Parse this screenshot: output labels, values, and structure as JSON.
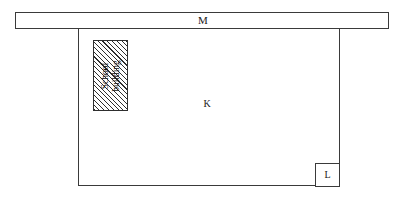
{
  "diagram": {
    "type": "site-plan",
    "canvas": {
      "width": 403,
      "height": 201,
      "background": "#ffffff"
    },
    "line_color": "#3a3a3a",
    "hatch_color": "#2e2e2e",
    "road_bar": {
      "label": "M",
      "name": "road-strip",
      "x": 15,
      "y": 12,
      "width": 374,
      "height": 17
    },
    "plot": {
      "label": "K",
      "name": "main-plot-area",
      "x": 78,
      "y": 28,
      "width": 262,
      "height": 158
    },
    "school_building": {
      "label_line1": "School",
      "label_line2": "building",
      "label_full": "School building",
      "fill": "diagonal-hatch",
      "rotation_deg": -90,
      "x": 93,
      "y": 40,
      "width": 35,
      "height": 71
    },
    "corner_box": {
      "label": "L",
      "name": "corner-parcel",
      "x": 315,
      "y": 163,
      "width": 25,
      "height": 24
    }
  }
}
